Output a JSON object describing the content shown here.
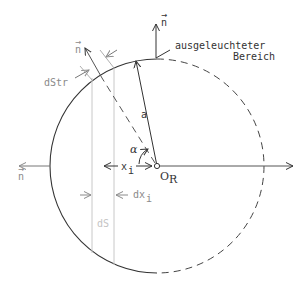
{
  "diagram": {
    "labels": {
      "normal_top": "n",
      "normal_upper_left": "n",
      "normal_left": "n",
      "illuminated_line1": "ausgeleuchteter",
      "illuminated_line2": "Bereich",
      "dStr": "dStr",
      "radius": "a",
      "angle": "α",
      "x_i": "x",
      "x_i_sub": "i",
      "dx_i": "dx",
      "dx_i_sub": "i",
      "dS": "dS",
      "origin": "O",
      "origin_sub": "R"
    },
    "colors": {
      "stroke": "#333333",
      "gray": "#8a8a8a",
      "light_gray": "#c8c8c8"
    }
  }
}
